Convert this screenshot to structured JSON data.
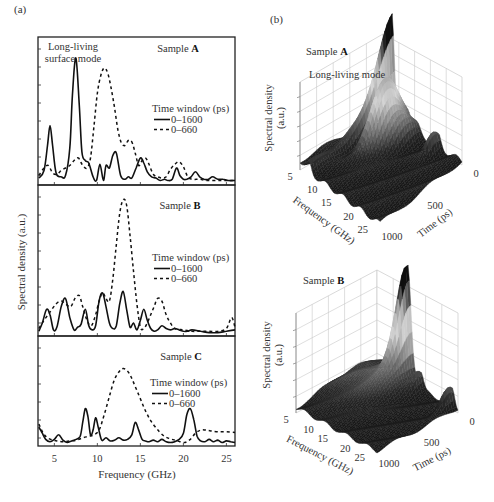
{
  "figure": {
    "panel_a_label": "(a)",
    "panel_b_label": "(b)"
  },
  "chart_data": [
    {
      "type": "line",
      "id": "panel-a-sample-A",
      "title": "Sample A",
      "annotation": "Long-living surface mode",
      "xlabel": "Frequency (GHz)",
      "ylabel": "Spectral density (a.u.)",
      "xlim": [
        3.1,
        26
      ],
      "xticks": [
        5,
        10,
        15,
        20,
        25
      ],
      "legend_title": "Time window (ps)",
      "series": [
        {
          "name": "0–1600",
          "style": "solid",
          "x": [
            3.2,
            3.8,
            4.2,
            4.5,
            4.8,
            5.2,
            5.8,
            6.3,
            6.8,
            7.1,
            7.5,
            7.9,
            8.2,
            8.6,
            9.0,
            9.5,
            9.9,
            10.3,
            10.7,
            11.0,
            11.4,
            11.8,
            12.2,
            12.7,
            13.2,
            13.6,
            14.0,
            14.5,
            15.0,
            15.4,
            15.8,
            16.3,
            16.8,
            17.3,
            17.8,
            18.2,
            18.7,
            19.2,
            19.6,
            20.0,
            20.4,
            20.9,
            21.4,
            21.9,
            22.4,
            22.9,
            23.4,
            24.0,
            24.6,
            25.2,
            26.0
          ],
          "y": [
            0.04,
            0.1,
            0.3,
            0.46,
            0.3,
            0.08,
            0.05,
            0.06,
            0.28,
            0.7,
            1.0,
            0.62,
            0.25,
            0.18,
            0.16,
            0.05,
            0.02,
            0.15,
            0.02,
            0.14,
            0.12,
            0.22,
            0.24,
            0.06,
            0.03,
            0.05,
            0.04,
            0.12,
            0.2,
            0.16,
            0.09,
            0.05,
            0.04,
            0.02,
            0.03,
            0.02,
            0.03,
            0.12,
            0.06,
            0.03,
            0.03,
            0.05,
            0.09,
            0.05,
            0.03,
            0.03,
            0.05,
            0.03,
            0.03,
            0.02,
            0.02
          ]
        },
        {
          "name": "0–660",
          "style": "dashed",
          "x": [
            3.2,
            3.8,
            4.3,
            4.8,
            5.3,
            5.8,
            6.3,
            6.8,
            7.3,
            7.8,
            8.3,
            8.8,
            9.2,
            9.6,
            10.0,
            10.4,
            10.8,
            11.2,
            11.6,
            12.0,
            12.4,
            12.8,
            13.2,
            13.6,
            14.0,
            14.4,
            14.8,
            15.2,
            15.6,
            16.0,
            16.5,
            17.0,
            17.5,
            18.0,
            18.5,
            19.0,
            19.5,
            20.0,
            20.5,
            21.0,
            21.5,
            22.0,
            22.5,
            23.0,
            24.0,
            25.0,
            26.0
          ],
          "y": [
            0.06,
            0.12,
            0.14,
            0.08,
            0.07,
            0.1,
            0.12,
            0.14,
            0.18,
            0.2,
            0.14,
            0.12,
            0.2,
            0.45,
            0.72,
            0.86,
            0.92,
            0.88,
            0.76,
            0.6,
            0.42,
            0.32,
            0.3,
            0.34,
            0.33,
            0.24,
            0.14,
            0.18,
            0.2,
            0.15,
            0.07,
            0.05,
            0.04,
            0.05,
            0.11,
            0.15,
            0.17,
            0.13,
            0.05,
            0.03,
            0.03,
            0.03,
            0.02,
            0.02,
            0.02,
            0.02,
            0.02
          ]
        }
      ]
    },
    {
      "type": "line",
      "id": "panel-a-sample-B",
      "title": "Sample B",
      "xlabel": "Frequency (GHz)",
      "ylabel": "Spectral density (a.u.)",
      "xlim": [
        3.1,
        26
      ],
      "legend_title": "Time window (ps)",
      "series": [
        {
          "name": "0–1600",
          "style": "solid",
          "x": [
            3.2,
            3.6,
            4.1,
            4.5,
            4.9,
            5.3,
            5.8,
            6.3,
            6.8,
            7.3,
            7.7,
            8.1,
            8.6,
            9.0,
            9.4,
            9.8,
            10.2,
            10.6,
            11.0,
            11.4,
            11.8,
            12.2,
            12.6,
            13.0,
            13.4,
            13.8,
            14.2,
            14.6,
            15.0,
            15.4,
            15.8,
            16.2,
            16.6,
            17.0,
            17.5,
            18.0,
            18.5,
            19.0,
            19.5,
            20.0,
            20.5,
            21.0,
            22.0,
            23.0,
            24.0,
            25.0,
            26.0
          ],
          "y": [
            0.02,
            0.08,
            0.18,
            0.14,
            0.03,
            0.05,
            0.2,
            0.26,
            0.12,
            0.03,
            0.05,
            0.07,
            0.18,
            0.06,
            0.03,
            0.06,
            0.24,
            0.3,
            0.2,
            0.08,
            0.04,
            0.06,
            0.22,
            0.31,
            0.18,
            0.05,
            0.08,
            0.03,
            0.1,
            0.18,
            0.1,
            0.04,
            0.02,
            0.03,
            0.06,
            0.04,
            0.03,
            0.04,
            0.03,
            0.02,
            0.02,
            0.03,
            0.02,
            0.01,
            0.01,
            0.02,
            0.03
          ]
        },
        {
          "name": "0–660",
          "style": "dashed",
          "x": [
            3.2,
            3.8,
            4.5,
            5.2,
            5.8,
            6.3,
            6.9,
            7.4,
            7.9,
            8.3,
            8.8,
            9.3,
            9.8,
            10.2,
            10.6,
            11.0,
            11.4,
            11.8,
            12.2,
            12.6,
            13.0,
            13.4,
            13.8,
            14.2,
            14.6,
            15.0,
            15.4,
            15.8,
            16.2,
            16.6,
            17.0,
            17.5,
            18.0,
            18.5,
            19.0,
            20.0,
            21.0,
            22.0,
            23.0,
            24.0,
            25.0,
            25.6,
            26.0
          ],
          "y": [
            0.04,
            0.1,
            0.16,
            0.22,
            0.24,
            0.22,
            0.2,
            0.26,
            0.28,
            0.2,
            0.1,
            0.06,
            0.14,
            0.24,
            0.3,
            0.26,
            0.24,
            0.4,
            0.65,
            0.88,
            0.98,
            0.94,
            0.72,
            0.46,
            0.22,
            0.05,
            0.04,
            0.08,
            0.14,
            0.2,
            0.26,
            0.24,
            0.14,
            0.08,
            0.04,
            0.03,
            0.02,
            0.02,
            0.02,
            0.02,
            0.04,
            0.12,
            0.05
          ]
        }
      ]
    },
    {
      "type": "line",
      "id": "panel-a-sample-C",
      "title": "Sample C",
      "xlabel": "Frequency (GHz)",
      "ylabel": "Spectral density (a.u.)",
      "xlim": [
        3.1,
        26
      ],
      "xticks": [
        5,
        10,
        15,
        20,
        25
      ],
      "legend_title": "Time window (ps)",
      "series": [
        {
          "name": "0–1600",
          "style": "solid",
          "x": [
            3.2,
            3.6,
            4.0,
            4.5,
            5.0,
            5.5,
            6.0,
            6.5,
            7.0,
            7.5,
            8.0,
            8.3,
            8.6,
            8.9,
            9.2,
            9.5,
            9.8,
            10.1,
            10.5,
            11.0,
            11.5,
            12.0,
            12.5,
            13.0,
            13.5,
            14.0,
            14.4,
            14.8,
            15.2,
            15.6,
            16.0,
            16.5,
            17.0,
            17.5,
            18.0,
            18.5,
            19.0,
            19.5,
            20.0,
            20.4,
            20.8,
            21.2,
            21.6,
            22.0,
            22.5,
            23.0,
            23.5,
            24.0,
            24.5,
            25.0,
            25.5,
            26.0
          ],
          "y": [
            0.22,
            0.14,
            0.06,
            0.03,
            0.06,
            0.12,
            0.05,
            0.02,
            0.04,
            0.06,
            0.1,
            0.28,
            0.46,
            0.36,
            0.12,
            0.18,
            0.34,
            0.22,
            0.05,
            0.08,
            0.04,
            0.05,
            0.08,
            0.05,
            0.06,
            0.12,
            0.28,
            0.18,
            0.06,
            0.04,
            0.03,
            0.05,
            0.03,
            0.06,
            0.03,
            0.02,
            0.03,
            0.06,
            0.14,
            0.38,
            0.46,
            0.32,
            0.1,
            0.04,
            0.03,
            0.06,
            0.03,
            0.05,
            0.02,
            0.04,
            0.03,
            0.02
          ]
        },
        {
          "name": "0–660",
          "style": "dashed",
          "x": [
            3.2,
            3.7,
            4.2,
            4.8,
            5.3,
            6.0,
            6.8,
            7.6,
            8.3,
            9.0,
            9.6,
            10.2,
            10.8,
            11.4,
            12.0,
            12.6,
            13.0,
            13.4,
            13.8,
            14.2,
            14.8,
            15.4,
            16.0,
            16.6,
            17.2,
            17.8,
            18.4,
            19.0,
            19.6,
            20.2,
            20.8,
            21.4,
            22.0,
            22.6,
            23.2,
            24.0,
            25.0,
            26.0
          ],
          "y": [
            0.26,
            0.14,
            0.08,
            0.05,
            0.04,
            0.03,
            0.04,
            0.05,
            0.08,
            0.1,
            0.12,
            0.18,
            0.38,
            0.62,
            0.84,
            0.95,
            0.98,
            0.96,
            0.9,
            0.8,
            0.64,
            0.48,
            0.34,
            0.24,
            0.16,
            0.1,
            0.07,
            0.05,
            0.03,
            0.02,
            0.06,
            0.14,
            0.18,
            0.18,
            0.17,
            0.16,
            0.16,
            0.15
          ]
        }
      ]
    },
    {
      "type": "surface3d",
      "id": "panel-b-sample-A",
      "title": "Sample A",
      "annotation": "Long-living mode",
      "xlabel": "Frequency (GHz)",
      "ylabel": "Time (ps)",
      "zlabel": "Spectral density (a.u.)",
      "frequency_ticks": [
        5,
        10,
        15,
        20,
        25
      ],
      "time_ticks": [
        0,
        500,
        1000
      ],
      "peaks": [
        {
          "frequency_ghz": 11.5,
          "time_ps": 200,
          "relative_height": 0.8
        },
        {
          "frequency_ghz": 7.5,
          "time_ps": 0,
          "relative_height": 1.0
        },
        {
          "frequency_ghz": 7.5,
          "time_ps": 1000,
          "relative_height": 0.35,
          "note": "long-living ridge"
        }
      ]
    },
    {
      "type": "surface3d",
      "id": "panel-b-sample-B",
      "title": "Sample B",
      "xlabel": "Frequency (GHz)",
      "ylabel": "Time (ps)",
      "zlabel": "Spectral density (a.u.)",
      "frequency_ticks": [
        5,
        10,
        15,
        20,
        25
      ],
      "time_ticks": [
        0,
        500,
        1000
      ],
      "peaks": [
        {
          "frequency_ghz": 13.3,
          "time_ps": 0,
          "relative_height": 1.0
        },
        {
          "frequency_ghz": 25,
          "time_ps": 0,
          "relative_height": 0.25
        }
      ]
    }
  ]
}
